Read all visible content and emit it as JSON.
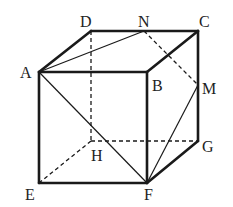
{
  "figure": {
    "colors": {
      "stroke": "#1a1a1a",
      "background": "#ffffff"
    },
    "vertices": {
      "A": [
        39,
        72
      ],
      "B": [
        147,
        72
      ],
      "C": [
        198,
        31
      ],
      "D": [
        91,
        31
      ],
      "E": [
        39,
        183
      ],
      "F": [
        147,
        183
      ],
      "G": [
        198,
        141
      ],
      "H": [
        91,
        141
      ],
      "N": [
        144,
        31
      ],
      "M": [
        198,
        85
      ]
    },
    "labels": {
      "A": "A",
      "B": "B",
      "C": "C",
      "D": "D",
      "E": "E",
      "F": "F",
      "G": "G",
      "H": "H",
      "M": "M",
      "N": "N"
    },
    "edges": {
      "solid_thick": [
        "AB",
        "BC",
        "CD",
        "DA",
        "AE",
        "EF",
        "FB",
        "FG",
        "GC"
      ],
      "dashed": [
        "DH",
        "HE",
        "HG",
        "NM"
      ],
      "solid_thin": [
        "AN",
        "AF",
        "FM"
      ]
    }
  }
}
